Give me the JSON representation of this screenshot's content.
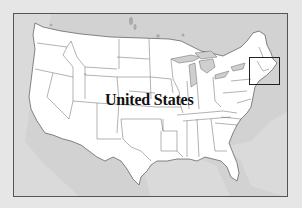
{
  "map": {
    "title_label": "United States",
    "highlight_region": "new-england",
    "colors": {
      "background": "#e6e6e6",
      "water_and_foreign_land": "#cfcfcf",
      "us_land": "#ffffff",
      "borders": "#555555",
      "frame": "#555555",
      "label": "#111111"
    }
  }
}
